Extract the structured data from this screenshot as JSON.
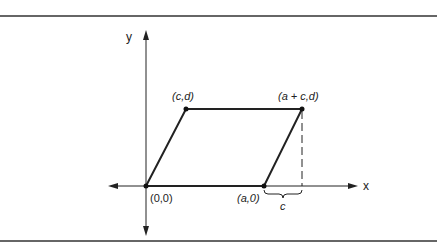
{
  "diagram": {
    "axes": {
      "x_label": "x",
      "y_label": "y"
    },
    "points": {
      "origin": "(0,0)",
      "a0": "(a,0)",
      "cd": "(c,d)",
      "acd": "(a + c,d)"
    },
    "brace_label": "c"
  }
}
